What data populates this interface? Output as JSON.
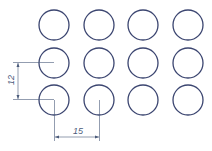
{
  "diagram": {
    "type": "hole pattern drawing",
    "grid": {
      "rows": 3,
      "columns": 4
    },
    "circle_color": "#3b4570",
    "dimension_color": "#4a5a7a",
    "circles": [
      {
        "row": 1,
        "col": 1,
        "cx": 54,
        "cy": 25
      },
      {
        "row": 1,
        "col": 2,
        "cx": 99,
        "cy": 25
      },
      {
        "row": 1,
        "col": 3,
        "cx": 143,
        "cy": 25
      },
      {
        "row": 1,
        "col": 4,
        "cx": 188,
        "cy": 25
      },
      {
        "row": 2,
        "col": 1,
        "cx": 54,
        "cy": 63
      },
      {
        "row": 2,
        "col": 2,
        "cx": 99,
        "cy": 63
      },
      {
        "row": 2,
        "col": 3,
        "cx": 143,
        "cy": 63
      },
      {
        "row": 2,
        "col": 4,
        "cx": 188,
        "cy": 63
      },
      {
        "row": 3,
        "col": 1,
        "cx": 54,
        "cy": 100
      },
      {
        "row": 3,
        "col": 2,
        "cx": 99,
        "cy": 100
      },
      {
        "row": 3,
        "col": 3,
        "cx": 143,
        "cy": 100
      },
      {
        "row": 3,
        "col": 4,
        "cx": 188,
        "cy": 100
      }
    ],
    "dimensions": {
      "vertical": {
        "label": "12"
      },
      "horizontal": {
        "label": "15"
      }
    }
  }
}
